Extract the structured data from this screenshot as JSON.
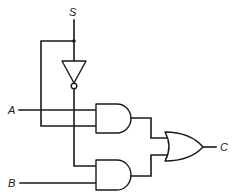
{
  "diagram": {
    "labels": {
      "select": "S",
      "input_a": "A",
      "input_b": "B",
      "output": "C"
    },
    "gates": [
      {
        "id": "not1",
        "type": "NOT",
        "inputs": [
          "S"
        ],
        "output": "S'"
      },
      {
        "id": "and1",
        "type": "AND",
        "inputs": [
          "A",
          "S"
        ],
        "output": "and1_out"
      },
      {
        "id": "and2",
        "type": "AND",
        "inputs": [
          "S'",
          "B"
        ],
        "output": "and2_out"
      },
      {
        "id": "or1",
        "type": "OR",
        "inputs": [
          "and1_out",
          "and2_out"
        ],
        "output": "C"
      }
    ],
    "colors": {
      "line": "#1a1a1a",
      "background": "#ffffff"
    }
  }
}
